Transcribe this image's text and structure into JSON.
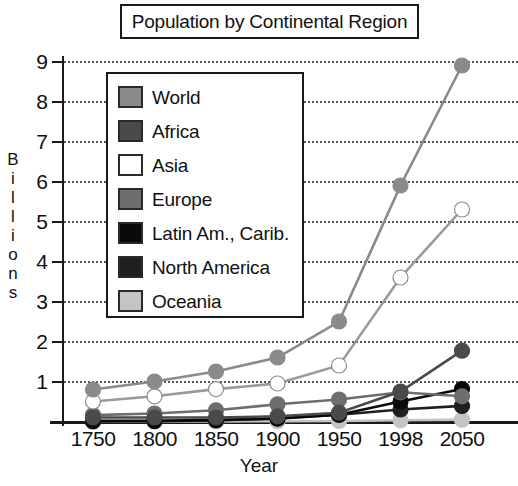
{
  "title": "Population by Continental Region",
  "axes": {
    "y_title_letters": [
      "B",
      "i",
      "l",
      "l",
      "i",
      "o",
      "n",
      "s"
    ],
    "y_title": "Billions",
    "x_title": "Year"
  },
  "legend": {
    "items": [
      {
        "label": "World",
        "color": "#8a8a8a"
      },
      {
        "label": "Africa",
        "color": "#4a4a4a"
      },
      {
        "label": "Asia",
        "color": "#ffffff"
      },
      {
        "label": "Europe",
        "color": "#6e6e6e"
      },
      {
        "label": "Latin Am., Carib.",
        "color": "#0a0a0a"
      },
      {
        "label": "North America",
        "color": "#1f1f1f"
      },
      {
        "label": "Oceania",
        "color": "#c4c4c4"
      }
    ]
  },
  "chart_data": {
    "type": "line",
    "title": "Population by Continental Region",
    "xlabel": "Year",
    "ylabel": "Billions",
    "categories": [
      "1750",
      "1800",
      "1850",
      "1900",
      "1950",
      "1998",
      "2050"
    ],
    "yticks": [
      1,
      2,
      3,
      4,
      5,
      6,
      7,
      8,
      9
    ],
    "ylim": [
      0,
      9.4
    ],
    "grid": true,
    "legend_position": "inside-upper-left",
    "series": [
      {
        "name": "World",
        "color": "#8a8a8a",
        "values": [
          0.8,
          1.0,
          1.25,
          1.6,
          2.5,
          5.9,
          8.9
        ]
      },
      {
        "name": "Africa",
        "color": "#4a4a4a",
        "values": [
          0.1,
          0.1,
          0.1,
          0.13,
          0.22,
          0.75,
          1.77
        ]
      },
      {
        "name": "Asia",
        "color": "#ffffff",
        "values": [
          0.5,
          0.63,
          0.81,
          0.95,
          1.4,
          3.6,
          5.3
        ]
      },
      {
        "name": "Europe",
        "color": "#6e6e6e",
        "values": [
          0.16,
          0.2,
          0.28,
          0.43,
          0.55,
          0.73,
          0.63
        ]
      },
      {
        "name": "Latin Am., Carib.",
        "color": "#0a0a0a",
        "values": [
          0.02,
          0.02,
          0.04,
          0.07,
          0.17,
          0.5,
          0.81
        ]
      },
      {
        "name": "North America",
        "color": "#1f1f1f",
        "values": [
          0.002,
          0.007,
          0.026,
          0.082,
          0.17,
          0.3,
          0.39
        ]
      },
      {
        "name": "Oceania",
        "color": "#c4c4c4",
        "values": [
          0.002,
          0.002,
          0.002,
          0.006,
          0.013,
          0.03,
          0.046
        ]
      }
    ]
  }
}
